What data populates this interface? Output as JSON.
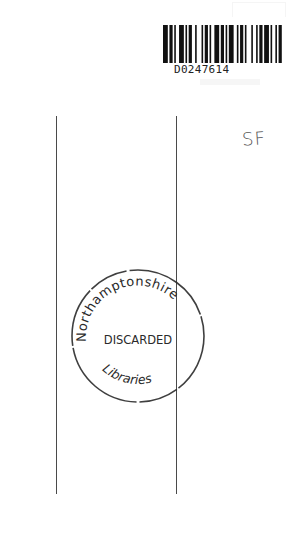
{
  "document": {
    "type": "library book endpaper",
    "barcode": {
      "number": "D0247614",
      "bars": [
        3,
        1,
        2,
        1,
        1,
        2,
        3,
        1,
        1,
        1,
        2,
        2,
        1,
        3,
        1,
        1,
        2,
        1,
        1,
        2,
        3,
        1,
        2,
        1,
        1,
        1,
        3,
        2,
        1,
        1,
        2,
        1,
        1,
        3,
        1,
        2,
        1,
        1,
        2,
        1,
        3,
        1,
        1,
        2,
        1,
        1,
        2,
        2
      ]
    },
    "handwritten_note": "SF",
    "stamp": {
      "top_arc_text": "Northamptonshire",
      "center_text": "DISCARDED",
      "bottom_arc_text": "Libraries",
      "color": "#2a2a2a"
    },
    "rules": {
      "count": 2,
      "color": "#4a4a4a"
    }
  }
}
